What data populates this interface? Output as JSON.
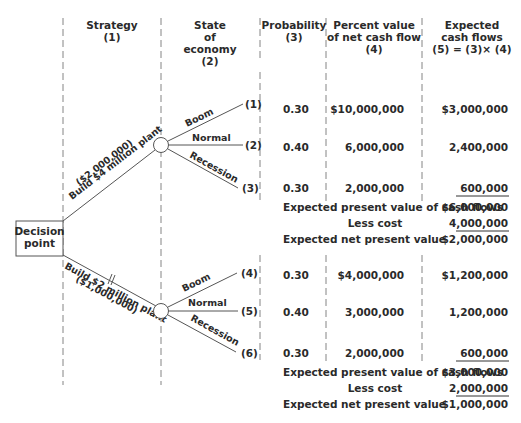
{
  "headers": {
    "strategy": [
      "Strategy",
      "(1)"
    ],
    "state": [
      "State",
      "of",
      "economy",
      "(2)"
    ],
    "probability": [
      "Probability",
      "(3)"
    ],
    "percent_value": [
      "Percent value",
      "of net cash flow",
      "(4)"
    ],
    "expected": [
      "Expected",
      "cash flows",
      "(5) = (3)× (4)"
    ]
  },
  "decision_node": [
    "Decision",
    "point"
  ],
  "strategies": [
    {
      "label": "Build $4 million plant",
      "cost_label": "($2,000,000)"
    },
    {
      "label": "Build $2 million plant",
      "cost_label": "($1,000,000)"
    }
  ],
  "branches": [
    {
      "state": "Boom",
      "num": "(1)",
      "prob": "0.30",
      "value": "$10,000,000",
      "expected": "$3,000,000"
    },
    {
      "state": "Normal",
      "num": "(2)",
      "prob": "0.40",
      "value": "6,000,000",
      "expected": "2,400,000"
    },
    {
      "state": "Recession",
      "num": "(3)",
      "prob": "0.30",
      "value": "2,000,000",
      "expected": "600,000"
    },
    {
      "state": "Boom",
      "num": "(4)",
      "prob": "0.30",
      "value": "$4,000,000",
      "expected": "$1,200,000"
    },
    {
      "state": "Normal",
      "num": "(5)",
      "prob": "0.40",
      "value": "3,000,000",
      "expected": "1,200,000"
    },
    {
      "state": "Recession",
      "num": "(6)",
      "prob": "0.30",
      "value": "2,000,000",
      "expected": "600,000"
    }
  ],
  "summaries": [
    {
      "epv_label": "Expected present value of cash flows",
      "epv": "$6,000,000",
      "less_label": "Less cost",
      "cost": "4,000,000",
      "npv_label": "Expected net present value",
      "npv": "$2,000,000"
    },
    {
      "epv_label": "Expected present value of cash flows",
      "epv": "$3,000,000",
      "less_label": "Less cost",
      "cost": "2,000,000",
      "npv_label": "Expected net present value",
      "npv": "$1,000,000"
    }
  ]
}
